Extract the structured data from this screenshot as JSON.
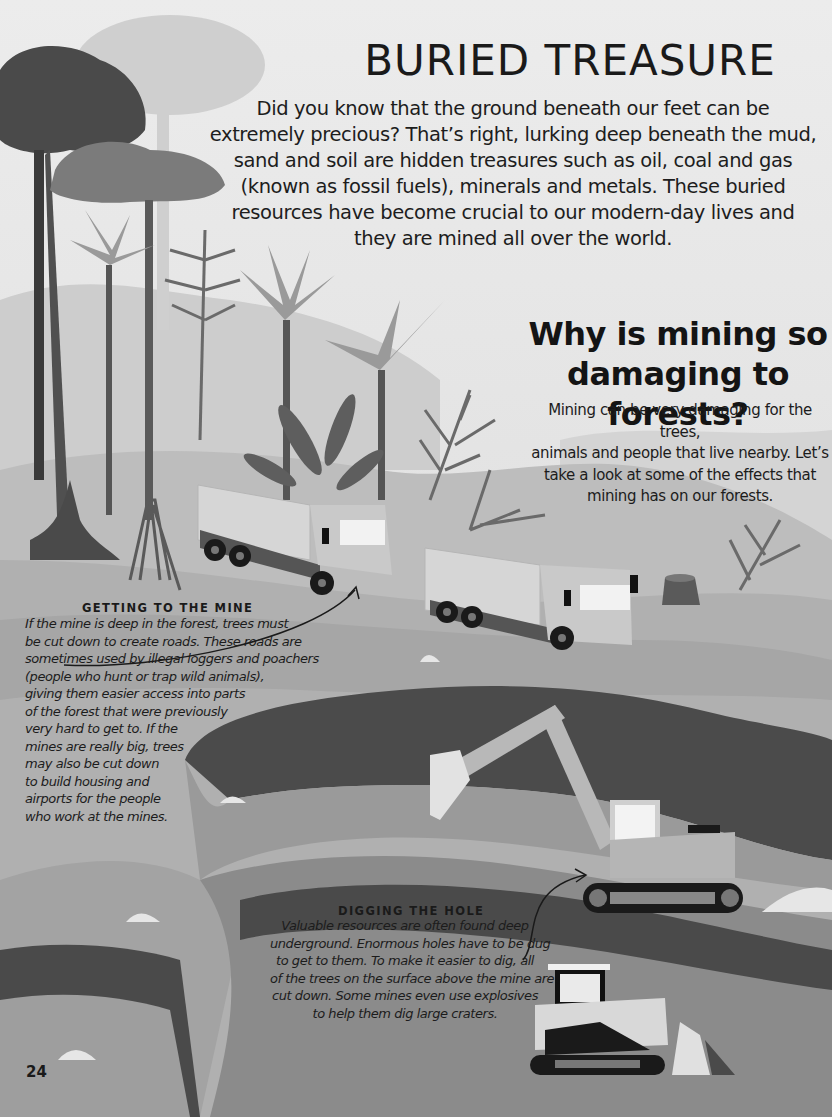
{
  "page": {
    "title": "BURIED TREASURE",
    "intro": "Did you know that the ground beneath our feet can be extremely precious? That’s right, lurking deep beneath the mud, sand and soil are hidden treasures such as oil, coal and gas (known as fossil fuels), minerals and metals. These buried resources have become crucial to our modern-day lives and they are mined all over the world.",
    "page_number": "24"
  },
  "section": {
    "heading_line1": "Why is mining so",
    "heading_line2": "damaging to forests?",
    "body_lines": [
      "Mining can be very damaging for the trees,",
      "animals and people that live nearby. Let’s",
      "take a look at some of the effects that",
      "mining has on our forests."
    ]
  },
  "captions": {
    "getting_to_mine": {
      "heading": "GETTING TO THE MINE",
      "lines": [
        "If the mine is deep in the forest, trees must",
        "be cut down to create roads. These roads are",
        "sometimes used by illegal loggers and poachers",
        "(people who hunt or trap wild animals),",
        "giving them easier access into parts",
        "of the forest that were previously",
        "very hard to get to. If the",
        "mines are really big, trees",
        "may also be cut down",
        "to build housing and",
        "airports for the people",
        "who work at the mines."
      ]
    },
    "digging_hole": {
      "heading": "DIGGING THE HOLE",
      "lines": [
        "Valuable resources are often found deep",
        "underground. Enormous holes have to be dug",
        "to get to them. To make it easier to dig, all",
        "of the trees on the surface above the mine are",
        "cut down. Some mines even use explosives",
        "to help them dig large craters."
      ]
    }
  },
  "illustration": {
    "elements": [
      "rainforest-trees",
      "palm-trees",
      "ferns",
      "logging-truck",
      "logging-truck",
      "tree-stump",
      "open-pit-mine",
      "excavator",
      "bulldozer",
      "rocks"
    ],
    "colors": {
      "sky": "#ececec",
      "ground_light": "#b9b9b9",
      "ground_mid": "#8d8d8d",
      "pit_wall": "#4a4a4a",
      "text": "#1a1a1a"
    }
  }
}
